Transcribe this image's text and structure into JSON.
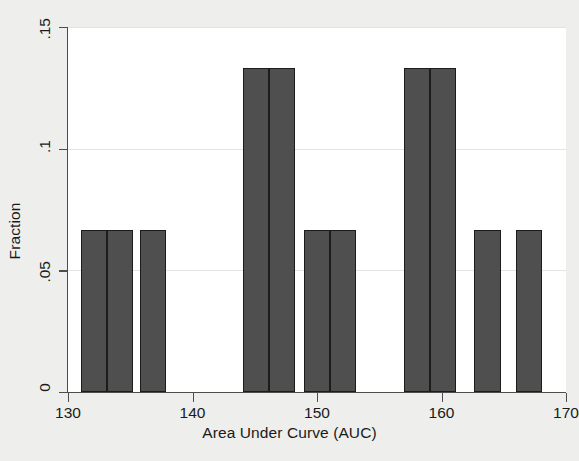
{
  "chart_data": {
    "type": "bar",
    "title": "",
    "subtitle": "",
    "xlabel": "Area Under Curve (AUC)",
    "ylabel": "Fraction",
    "xlim": [
      130,
      170
    ],
    "ylim": [
      0,
      0.15
    ],
    "xticks": [
      "130",
      "140",
      "150",
      "160",
      "170"
    ],
    "xtick_values": [
      130,
      140,
      150,
      160,
      170
    ],
    "yticks": [
      "0",
      ".05",
      ".1",
      ".15"
    ],
    "ytick_values": [
      0,
      0.05,
      0.1,
      0.15
    ],
    "grid": "horizontal",
    "legend": "none",
    "bin_width": 2.1,
    "bar_color": "#4f4f4f",
    "bar_edge_color": "#1c1c1c",
    "plot_background": "#ffffff",
    "figure_background": "#eeeeec",
    "grid_color": "#e3e3e3",
    "axis_color": "#4d4d4d",
    "categories": [
      132.1,
      134.2,
      136.8,
      145.1,
      147.2,
      150.0,
      152.1,
      158.0,
      160.1,
      163.7,
      167.0
    ],
    "values": [
      0.0667,
      0.0667,
      0.0667,
      0.1333,
      0.1333,
      0.0667,
      0.0667,
      0.1333,
      0.1333,
      0.0667,
      0.0667
    ],
    "bars": [
      {
        "bin_center": 132.1,
        "x_start": 131.05,
        "x_end": 133.15,
        "value": 0.0667
      },
      {
        "bin_center": 134.2,
        "x_start": 133.15,
        "x_end": 135.25,
        "value": 0.0667
      },
      {
        "bin_center": 136.8,
        "x_start": 135.75,
        "x_end": 137.85,
        "value": 0.0667
      },
      {
        "bin_center": 145.1,
        "x_start": 144.05,
        "x_end": 146.15,
        "value": 0.1333
      },
      {
        "bin_center": 147.2,
        "x_start": 146.15,
        "x_end": 148.25,
        "value": 0.1333
      },
      {
        "bin_center": 150.0,
        "x_start": 148.95,
        "x_end": 151.05,
        "value": 0.0667
      },
      {
        "bin_center": 152.1,
        "x_start": 151.05,
        "x_end": 153.15,
        "value": 0.0667
      },
      {
        "bin_center": 158.0,
        "x_start": 156.95,
        "x_end": 159.05,
        "value": 0.1333
      },
      {
        "bin_center": 160.1,
        "x_start": 159.05,
        "x_end": 161.15,
        "value": 0.1333
      },
      {
        "bin_center": 163.7,
        "x_start": 162.65,
        "x_end": 164.75,
        "value": 0.0667
      },
      {
        "bin_center": 167.0,
        "x_start": 165.95,
        "x_end": 168.05,
        "value": 0.0667
      }
    ]
  }
}
